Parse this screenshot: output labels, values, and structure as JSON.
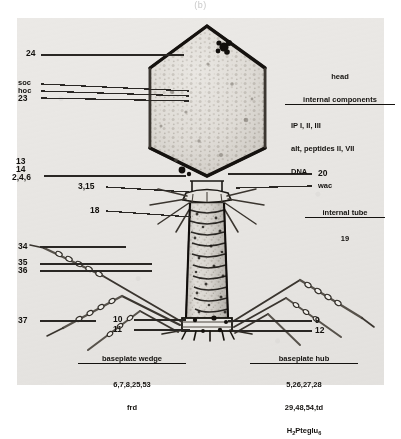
{
  "figure": {
    "panel_letter": "(b)"
  },
  "labels": {
    "gp24": "24",
    "soc": "soc",
    "hoc": "hoc",
    "gp23": "23",
    "gp13": "13",
    "gp14": "14",
    "wac_246": "2,4,6",
    "gp3_15": "3,15",
    "gp18": "18",
    "gp20": "20",
    "wac": "wac",
    "gp19": "19",
    "gp34": "34",
    "gp35": "35",
    "gp36": "36",
    "gp37": "37",
    "gp10": "10",
    "gp11": "11",
    "gp9": "9",
    "gp12": "12"
  },
  "blocks": {
    "head": {
      "title_line1": "head",
      "title_line2": "internal components",
      "lines": [
        "IP I, II, III",
        "alt, peptides II, VII",
        "DNA"
      ]
    },
    "internal_tube": {
      "title": "internal tube"
    },
    "baseplate_wedge": {
      "title": "baseplate wedge",
      "lines": [
        "6,7,8,25,53",
        "frd"
      ]
    },
    "baseplate_hub": {
      "title": "baseplate hub",
      "lines": [
        "5,26,27,28",
        "29,48,54,td"
      ],
      "formula_pre": "H",
      "formula_sub1": "2",
      "formula_mid": "Pteglu",
      "formula_sub2": "6"
    }
  },
  "colors": {
    "plate_background": "#ebe9e6",
    "ink": "#14120f",
    "leader_line": "#2a2724",
    "panel_letter": "#c9c9c9",
    "page_background": "#ffffff"
  }
}
